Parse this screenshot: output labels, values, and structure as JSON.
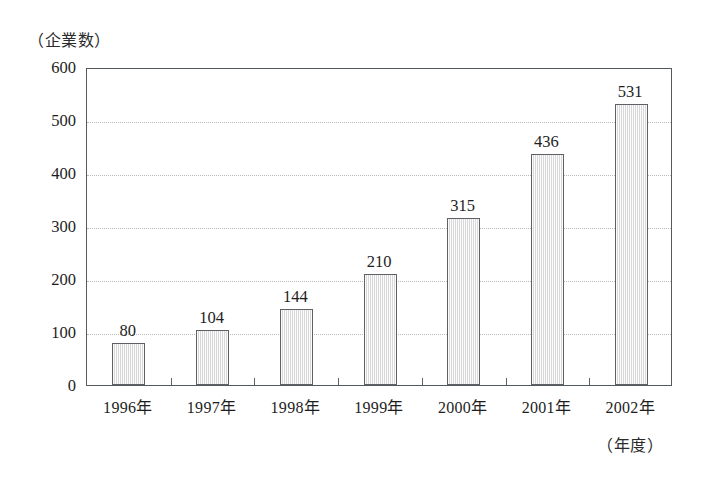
{
  "chart_data": {
    "type": "bar",
    "title": "",
    "subtitle": "",
    "xlabel": "（年度）",
    "ylabel": "（企業数）",
    "categories": [
      "1996年",
      "1997年",
      "1998年",
      "1999年",
      "2000年",
      "2001年",
      "2002年"
    ],
    "values": [
      80,
      104,
      144,
      210,
      315,
      436,
      531
    ],
    "value_labels": [
      "80",
      "104",
      "144",
      "210",
      "315",
      "436",
      "531"
    ],
    "ylim": [
      0,
      600
    ],
    "ytick_values": [
      0,
      100,
      200,
      300,
      400,
      500,
      600
    ],
    "ytick_labels": [
      "0",
      "100",
      "200",
      "300",
      "400",
      "500",
      "600"
    ],
    "gridlines_at": [
      100,
      200,
      300,
      400,
      500
    ],
    "grid": true,
    "legend": "none",
    "bar_fill_color": "#e9e9e9",
    "bar_border_color": "#5d6165",
    "grid_color": "#b9b9b9",
    "frame_color": "#555a5e",
    "background_color": "#ffffff",
    "text_color": "#1d1d1d"
  }
}
